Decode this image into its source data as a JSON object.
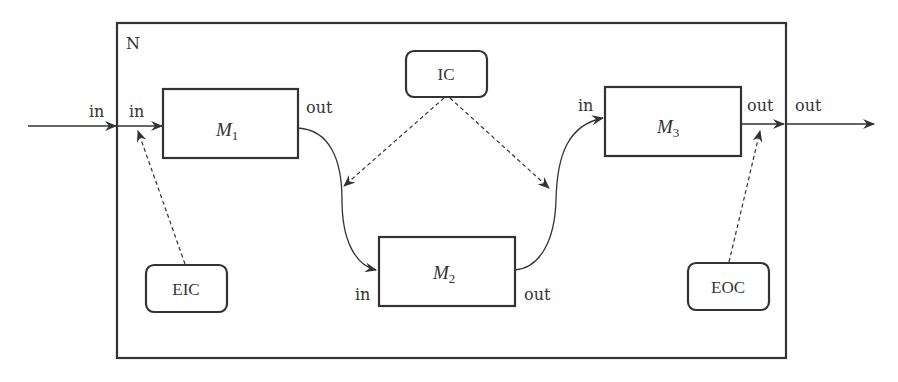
{
  "diagram": {
    "network": {
      "label": "N"
    },
    "models": [
      {
        "id": "M1",
        "base": "M",
        "sub": "1",
        "in_port": "in",
        "out_port": "out"
      },
      {
        "id": "M2",
        "base": "M",
        "sub": "2",
        "in_port": "in",
        "out_port": "out"
      },
      {
        "id": "M3",
        "base": "M",
        "sub": "3",
        "in_port": "in",
        "out_port": "out"
      }
    ],
    "couplings": [
      {
        "id": "IC",
        "label": "IC"
      },
      {
        "id": "EIC",
        "label": "EIC"
      },
      {
        "id": "EOC",
        "label": "EOC"
      }
    ],
    "external": {
      "in_label": "in",
      "out_label": "out"
    },
    "colors": {
      "stroke": "#333333",
      "background": "#ffffff"
    }
  }
}
